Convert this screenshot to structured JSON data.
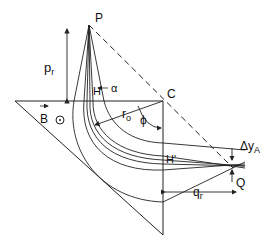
{
  "diagram": {
    "labels": {
      "P": "P",
      "p_r": "p",
      "p_r_sub": "r",
      "alpha": "α",
      "H": "H",
      "C": "C",
      "B": "B",
      "r_o": "r",
      "r_o_sub": "o",
      "phi": "ϕ",
      "H_prime": "H'",
      "delta_y": "Δy",
      "delta_y_sub": "A",
      "Q": "Q",
      "q_r": "q",
      "q_r_sub": "r"
    },
    "colors": {
      "line": "#222222",
      "background": "#ffffff"
    }
  }
}
